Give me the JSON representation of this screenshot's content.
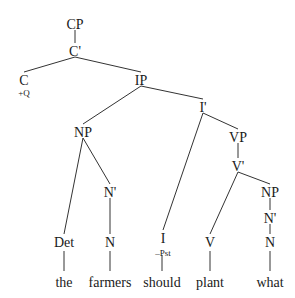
{
  "diagram": {
    "type": "syntax-tree",
    "nodes": {
      "cp": {
        "label": "CP",
        "x": 75,
        "y": 24
      },
      "cbar": {
        "label": "C'",
        "x": 75,
        "y": 51
      },
      "c": {
        "label": "C",
        "x": 24,
        "y": 80,
        "feature": "+Q"
      },
      "ip": {
        "label": "IP",
        "x": 141,
        "y": 80
      },
      "ibar": {
        "label": "I'",
        "x": 203,
        "y": 107
      },
      "np_subj": {
        "label": "NP",
        "x": 83,
        "y": 132
      },
      "nbar_subj": {
        "label": "N'",
        "x": 110,
        "y": 192
      },
      "det": {
        "label": "Det",
        "x": 64,
        "y": 242
      },
      "n_subj": {
        "label": "N",
        "x": 110,
        "y": 242
      },
      "i": {
        "label": "I",
        "x": 163,
        "y": 238,
        "feature": "–Pst"
      },
      "vp": {
        "label": "VP",
        "x": 238,
        "y": 137
      },
      "vbar": {
        "label": "V'",
        "x": 238,
        "y": 166
      },
      "v": {
        "label": "V",
        "x": 210,
        "y": 242
      },
      "np_obj": {
        "label": "NP",
        "x": 270,
        "y": 192
      },
      "nbar_obj": {
        "label": "N'",
        "x": 270,
        "y": 218
      },
      "n_obj": {
        "label": "N",
        "x": 270,
        "y": 242
      }
    },
    "words": [
      {
        "text": "the",
        "x": 64
      },
      {
        "text": "farmers",
        "x": 110
      },
      {
        "text": "should",
        "x": 162
      },
      {
        "text": "plant",
        "x": 210
      },
      {
        "text": "what",
        "x": 270
      }
    ],
    "words_y": 283,
    "edges": [
      [
        "cp",
        "cbar"
      ],
      [
        "cbar",
        "c"
      ],
      [
        "cbar",
        "ip"
      ],
      [
        "ip",
        "np_subj"
      ],
      [
        "ip",
        "ibar"
      ],
      [
        "np_subj",
        "det"
      ],
      [
        "np_subj",
        "nbar_subj"
      ],
      [
        "nbar_subj",
        "n_subj"
      ],
      [
        "ibar",
        "i"
      ],
      [
        "ibar",
        "vp"
      ],
      [
        "vp",
        "vbar"
      ],
      [
        "vbar",
        "v"
      ],
      [
        "vbar",
        "np_obj"
      ],
      [
        "np_obj",
        "nbar_obj"
      ],
      [
        "nbar_obj",
        "n_obj"
      ]
    ],
    "colors": {
      "ink": "#1a1a1a",
      "line": "#333333",
      "background": "#ffffff"
    }
  }
}
